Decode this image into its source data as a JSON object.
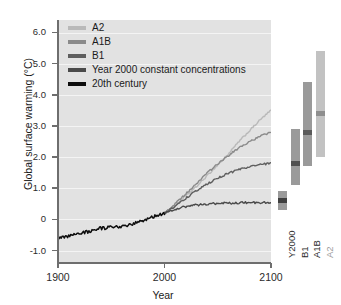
{
  "chart_data": {
    "type": "line",
    "title": "",
    "xlabel": "Year",
    "ylabel": "Global surface warming (°C)",
    "xlim": [
      1900,
      2100
    ],
    "ylim": [
      -1.4,
      6.4
    ],
    "xticks": [
      1900,
      2000,
      2100
    ],
    "xticklabels": [
      "1900",
      "2000",
      "2100"
    ],
    "yticks": [
      -1.0,
      0,
      1.0,
      2.0,
      3.0,
      4.0,
      5.0,
      6.0
    ],
    "yticklabels": [
      "-1.0",
      "0",
      "1.0",
      "2.0",
      "3.0",
      "4.0",
      "5.0",
      "6.0"
    ],
    "grid": true,
    "legend_position": "upper left",
    "plot_background": "#e2e2e2",
    "gridline_color": "#f4f4f4",
    "series": [
      {
        "name": "A2",
        "color": "#b9b9b9",
        "x": [
          2000,
          2010,
          2020,
          2030,
          2040,
          2050,
          2060,
          2070,
          2080,
          2090,
          2100
        ],
        "values": [
          0.2,
          0.45,
          0.75,
          1.05,
          1.4,
          1.75,
          2.1,
          2.5,
          2.85,
          3.2,
          3.5
        ]
      },
      {
        "name": "A1B",
        "color": "#8a8a8a",
        "x": [
          2000,
          2010,
          2020,
          2030,
          2040,
          2050,
          2060,
          2070,
          2080,
          2090,
          2100
        ],
        "values": [
          0.2,
          0.5,
          0.82,
          1.15,
          1.48,
          1.78,
          2.05,
          2.3,
          2.5,
          2.67,
          2.8
        ]
      },
      {
        "name": "B1",
        "color": "#5e5e5e",
        "x": [
          2000,
          2010,
          2020,
          2030,
          2040,
          2050,
          2060,
          2070,
          2080,
          2090,
          2100
        ],
        "values": [
          0.2,
          0.42,
          0.68,
          0.92,
          1.13,
          1.32,
          1.48,
          1.6,
          1.69,
          1.76,
          1.8
        ]
      },
      {
        "name": "Year 2000 constant concentrations",
        "color": "#4a4a4a",
        "x": [
          2000,
          2010,
          2020,
          2030,
          2040,
          2050,
          2060,
          2070,
          2080,
          2090,
          2100
        ],
        "values": [
          0.2,
          0.33,
          0.41,
          0.46,
          0.49,
          0.51,
          0.52,
          0.53,
          0.54,
          0.54,
          0.55
        ]
      },
      {
        "name": "20th century",
        "color": "#0d0d0d",
        "x": [
          1900,
          1910,
          1920,
          1930,
          1940,
          1950,
          1960,
          1970,
          1980,
          1990,
          2000
        ],
        "values": [
          -0.62,
          -0.55,
          -0.45,
          -0.38,
          -0.28,
          -0.26,
          -0.22,
          -0.16,
          -0.02,
          0.1,
          0.2
        ]
      }
    ],
    "range_bars": [
      {
        "label": "Y2000",
        "color": "#9a9a9a",
        "marker_color": "#3f3f3f",
        "low": 0.3,
        "high": 0.9,
        "best_estimate": 0.6
      },
      {
        "label": "B1",
        "color": "#9a9a9a",
        "marker_color": "#4f4f4f",
        "low": 1.1,
        "high": 2.9,
        "best_estimate": 1.8
      },
      {
        "label": "A1B",
        "color": "#9a9a9a",
        "marker_color": "#5a5a5a",
        "low": 1.7,
        "high": 4.4,
        "best_estimate": 2.8
      },
      {
        "label": "A2",
        "color": "#c2c2c2",
        "marker_color": "#8e8e8e",
        "low": 2.0,
        "high": 5.4,
        "best_estimate": 3.4
      }
    ]
  },
  "legend": {
    "items": [
      {
        "label": "A2",
        "color": "#b9b9b9"
      },
      {
        "label": "A1B",
        "color": "#8a8a8a"
      },
      {
        "label": "B1",
        "color": "#5e5e5e"
      },
      {
        "label": "Year 2000 constant concentrations",
        "color": "#4a4a4a"
      },
      {
        "label": "20th century",
        "color": "#0d0d0d"
      }
    ]
  }
}
